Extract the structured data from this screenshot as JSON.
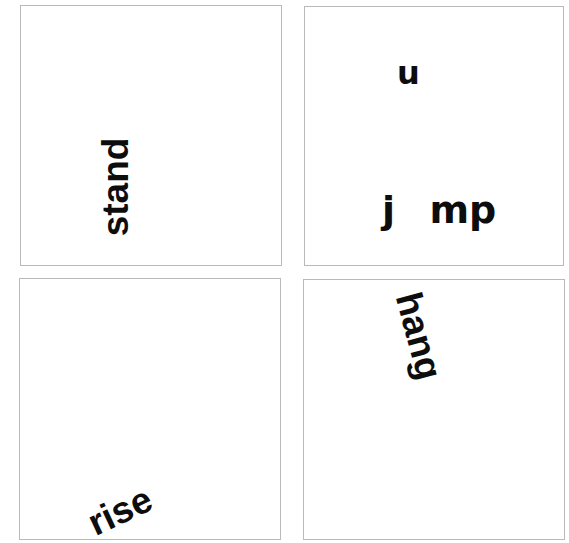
{
  "panels": [
    {
      "id": "panel-1",
      "words": [
        {
          "text": "stand",
          "rotation_deg": -90
        }
      ]
    },
    {
      "id": "panel-2",
      "words": [
        {
          "text": "u",
          "rotation_deg": 0
        },
        {
          "text": "j  mp",
          "rotation_deg": 0
        }
      ]
    },
    {
      "id": "panel-3",
      "words": [
        {
          "text": "rise",
          "rotation_deg": -25
        }
      ]
    },
    {
      "id": "panel-4",
      "words": [
        {
          "text": "hang",
          "rotation_deg": 75
        }
      ]
    }
  ],
  "colors": {
    "background": "#ffffff",
    "panel_border": "#b9b9b9",
    "text": "#0d0d0d"
  }
}
